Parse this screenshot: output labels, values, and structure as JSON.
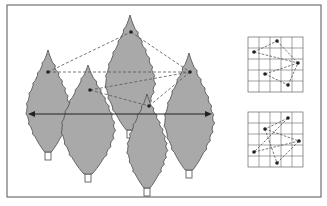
{
  "figure": {
    "frame": {
      "x": 7,
      "y": 5,
      "w": 314,
      "h": 192
    },
    "colors": {
      "tree_fill": "#a9a9a9",
      "tree_stroke": "#4a4a4a",
      "line": "#444444",
      "dashed": "#555555",
      "grid": "#666666",
      "point": "#222222",
      "frame": "#555555"
    },
    "trees": [
      {
        "id": "tree-1",
        "cx": 48,
        "top": 50,
        "bottom": 152,
        "halfw": 22,
        "trunk_y": 153
      },
      {
        "id": "tree-2",
        "cx": 88,
        "top": 65,
        "bottom": 174,
        "halfw": 27,
        "trunk_y": 175
      },
      {
        "id": "tree-3",
        "cx": 130,
        "top": 15,
        "bottom": 130,
        "halfw": 25,
        "trunk_y": 131
      },
      {
        "id": "tree-5",
        "cx": 189,
        "top": 53,
        "bottom": 170,
        "halfw": 25,
        "trunk_y": 171
      },
      {
        "id": "tree-4",
        "cx": 147,
        "top": 94,
        "bottom": 188,
        "halfw": 20,
        "trunk_y": 189
      }
    ],
    "points": [
      {
        "id": "p1",
        "x": 48,
        "y": 72
      },
      {
        "id": "p2",
        "x": 131,
        "y": 32
      },
      {
        "id": "p3",
        "x": 190,
        "y": 72
      },
      {
        "id": "p4",
        "x": 90,
        "y": 90
      },
      {
        "id": "p5",
        "x": 149,
        "y": 106
      }
    ],
    "dashed_edges": [
      [
        "p1",
        "p2"
      ],
      [
        "p2",
        "p3"
      ],
      [
        "p1",
        "p3"
      ],
      [
        "p4",
        "p3"
      ],
      [
        "p4",
        "p5"
      ],
      [
        "p5",
        "p3"
      ]
    ],
    "arrow": {
      "x1": 28,
      "y1": 114,
      "x2": 212,
      "y2": 114
    },
    "grids": [
      {
        "id": "grid-top",
        "x": 248,
        "y": 37,
        "cell": 11,
        "cols": 5,
        "rows": 5,
        "points": [
          [
            254,
            52
          ],
          [
            277,
            41
          ],
          [
            298,
            63
          ],
          [
            265,
            74
          ],
          [
            288,
            85
          ]
        ],
        "edges": [
          [
            0,
            1
          ],
          [
            1,
            2
          ],
          [
            0,
            2
          ],
          [
            2,
            3
          ],
          [
            3,
            4
          ],
          [
            4,
            2
          ]
        ]
      },
      {
        "id": "grid-top-bottom",
        "x": 248,
        "y": 112,
        "cell": 11,
        "cols": 5,
        "rows": 5,
        "points": [
          [
            288,
            118
          ],
          [
            265,
            129
          ],
          [
            299,
            141
          ],
          [
            254,
            152
          ],
          [
            277,
            163
          ]
        ],
        "edges": [
          [
            0,
            1
          ],
          [
            1,
            2
          ],
          [
            0,
            3
          ],
          [
            3,
            2
          ],
          [
            1,
            4
          ],
          [
            4,
            2
          ]
        ]
      }
    ]
  }
}
